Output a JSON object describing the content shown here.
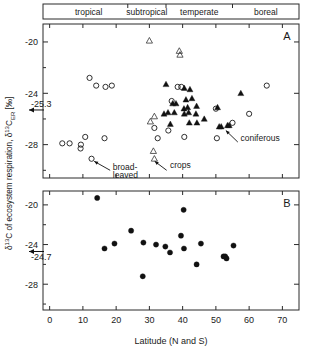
{
  "figure": {
    "xlabel": "Latitude (N and S)",
    "ylabel": "δ¹³C of ecosystem respiration, δ¹³C",
    "ylabel_sub": "ER",
    "ylabel_unit": " [‰]",
    "xticks": [
      "0",
      "10",
      "20",
      "30",
      "40",
      "50",
      "60",
      "70"
    ],
    "xtick_values": [
      0,
      10,
      20,
      30,
      40,
      50,
      60,
      70
    ],
    "yticks": [
      "-20",
      "-24",
      "-28"
    ],
    "ytick_values": [
      -20,
      -24,
      -28
    ],
    "xlim": [
      -2,
      75
    ],
    "ylim_a": [
      -30.6,
      -18.6
    ],
    "ylim_b": [
      -30.6,
      -18.6
    ],
    "zones": [
      {
        "label": "tropical",
        "start": 0,
        "end": 23.5
      },
      {
        "label": "subtropical",
        "start": 23.5,
        "end": 35
      },
      {
        "label": "temperate",
        "start": 35,
        "end": 55
      },
      {
        "label": "boreal",
        "start": 55,
        "end": 75
      }
    ],
    "panel_a_label": "A",
    "panel_b_label": "B",
    "mean_a_label": "-25.3",
    "mean_a_value": -25.3,
    "mean_b_label": "-24.7",
    "mean_b_value": -24.7,
    "annotations_a": [
      {
        "label": "broad-leaved",
        "line1": "broad-",
        "line2": "leaved"
      },
      {
        "label": "crops",
        "line1": "crops",
        "line2": ""
      },
      {
        "label": "coniferous",
        "line1": "coniferous",
        "line2": ""
      }
    ]
  },
  "chart_data": [
    {
      "type": "scatter",
      "panel": "A",
      "title": "A",
      "xlabel": "Latitude (N and S)",
      "ylabel": "δ¹³C of ecosystem respiration, δ¹³C_ER [‰]",
      "xlim": [
        -2,
        75
      ],
      "ylim": [
        -30.6,
        -18.6
      ],
      "grid": false,
      "reference_line": {
        "label": "-25.3",
        "value": -25.3,
        "style": "arrow-left-axis"
      },
      "series": [
        {
          "name": "broad-leaved",
          "marker": "open-circle",
          "points": [
            [
              12.0,
              -22.8
            ],
            [
              14.0,
              -23.4
            ],
            [
              16.8,
              -23.5
            ],
            [
              18.7,
              -23.4
            ],
            [
              3.8,
              -27.9
            ],
            [
              6.0,
              -27.9
            ],
            [
              9.3,
              -28.3
            ],
            [
              9.4,
              -28.0
            ],
            [
              10.7,
              -27.4
            ],
            [
              16.5,
              -27.5
            ],
            [
              12.6,
              -29.1
            ],
            [
              31.5,
              -26.7
            ],
            [
              32.5,
              -27.5
            ],
            [
              36.7,
              -24.6
            ],
            [
              35.7,
              -26.9
            ],
            [
              38.5,
              -23.5
            ],
            [
              39.6,
              -23.5
            ],
            [
              40.5,
              -27.4
            ],
            [
              50.0,
              -25.2
            ],
            [
              50.3,
              -27.5
            ],
            [
              55.0,
              -26.3
            ],
            [
              60.0,
              -25.6
            ],
            [
              65.3,
              -23.4
            ]
          ]
        },
        {
          "name": "coniferous",
          "marker": "filled-triangle",
          "points": [
            [
              35.0,
              -23.3
            ],
            [
              40.5,
              -23.6
            ],
            [
              42.2,
              -23.7
            ],
            [
              37.0,
              -24.8
            ],
            [
              38.0,
              -24.8
            ],
            [
              41.0,
              -24.5
            ],
            [
              42.8,
              -24.4
            ],
            [
              40.4,
              -25.2
            ],
            [
              41.5,
              -25.1
            ],
            [
              44.2,
              -25.0
            ],
            [
              34.4,
              -25.6
            ],
            [
              35.6,
              -25.5
            ],
            [
              37.5,
              -25.5
            ],
            [
              40.5,
              -25.6
            ],
            [
              41.8,
              -25.5
            ],
            [
              44.0,
              -25.6
            ],
            [
              36.3,
              -26.4
            ],
            [
              42.0,
              -26.3
            ],
            [
              44.3,
              -26.3
            ],
            [
              50.5,
              -25.1
            ],
            [
              51.0,
              -26.6
            ],
            [
              51.6,
              -26.6
            ],
            [
              53.5,
              -26.5
            ],
            [
              54.0,
              -26.5
            ],
            [
              46.5,
              -26.0
            ],
            [
              57.5,
              -24.0
            ]
          ]
        },
        {
          "name": "crops",
          "marker": "open-triangle",
          "points": [
            [
              30.0,
              -19.9
            ],
            [
              39.0,
              -20.7
            ],
            [
              39.2,
              -21.0
            ],
            [
              31.5,
              -25.8
            ],
            [
              30.3,
              -26.2
            ],
            [
              31.2,
              -28.5
            ],
            [
              31.5,
              -29.1
            ]
          ]
        }
      ]
    },
    {
      "type": "scatter",
      "panel": "B",
      "title": "B",
      "xlabel": "Latitude (N and S)",
      "ylabel": "δ¹³C of ecosystem respiration, δ¹³C_ER [‰]",
      "xlim": [
        -2,
        75
      ],
      "ylim": [
        -30.6,
        -18.6
      ],
      "grid": false,
      "reference_line": {
        "label": "-24.7",
        "value": -24.7,
        "style": "arrow-left-axis"
      },
      "series": [
        {
          "name": "site means",
          "marker": "filled-circle",
          "points": [
            [
              16.5,
              -24.4
            ],
            [
              19.5,
              -23.9
            ],
            [
              24.5,
              -22.6
            ],
            [
              28.2,
              -23.8
            ],
            [
              28.0,
              -27.2
            ],
            [
              32.0,
              -24.0
            ],
            [
              34.8,
              -24.2
            ],
            [
              36.2,
              -24.8
            ],
            [
              39.5,
              -23.1
            ],
            [
              40.3,
              -20.5
            ],
            [
              40.4,
              -24.4
            ],
            [
              44.2,
              -26.0
            ],
            [
              45.5,
              -23.9
            ],
            [
              52.3,
              -25.2
            ],
            [
              52.8,
              -25.2
            ],
            [
              53.2,
              -25.4
            ],
            [
              55.3,
              -24.1
            ],
            [
              14.3,
              -19.3
            ]
          ]
        }
      ]
    }
  ]
}
